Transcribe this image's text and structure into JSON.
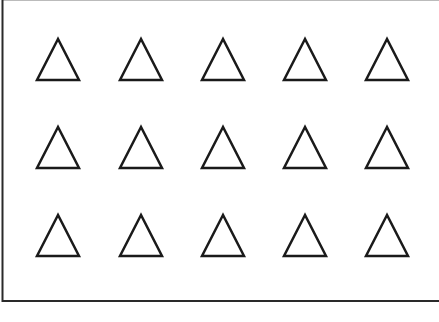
{
  "figure": {
    "rows": 3,
    "columns": 5,
    "shape": "triangle-outline",
    "stroke_color": "#1a1a1a",
    "frame_color": "#2a2a2a",
    "background_color": "#ffffff",
    "total_shapes": 15
  }
}
